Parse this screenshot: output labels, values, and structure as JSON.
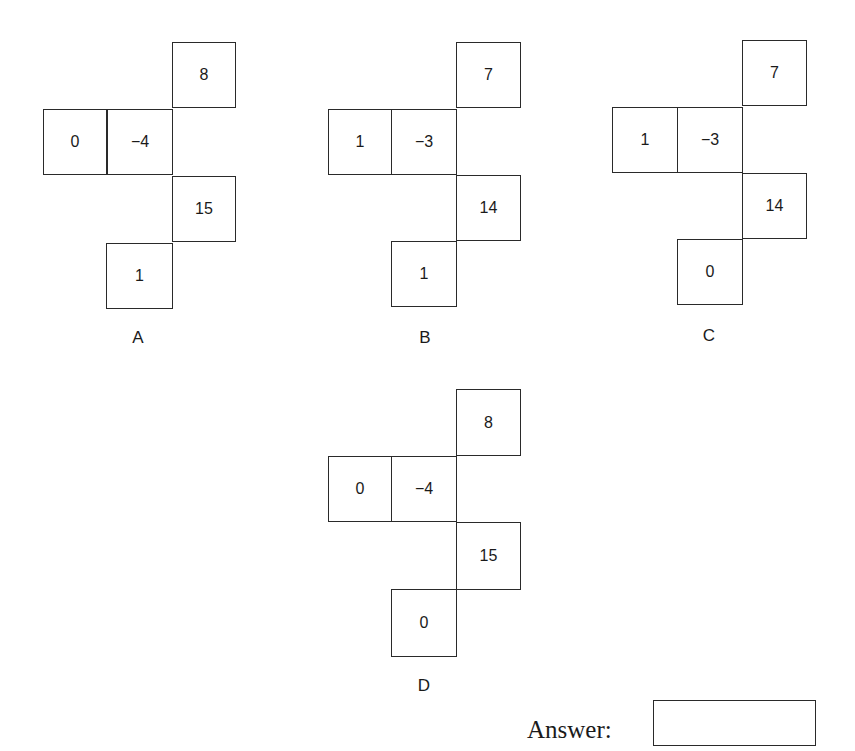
{
  "question": {
    "figures": [
      {
        "label": "A",
        "cells": {
          "top": "8",
          "left_outer": "0",
          "left_inner": "−4",
          "right_lower": "15",
          "bottom": "1"
        }
      },
      {
        "label": "B",
        "cells": {
          "top": "7",
          "left_outer": "1",
          "left_inner": "−3",
          "right_lower": "14",
          "bottom": "1"
        }
      },
      {
        "label": "C",
        "cells": {
          "top": "7",
          "left_outer": "1",
          "left_inner": "−3",
          "right_lower": "14",
          "bottom": "0"
        }
      },
      {
        "label": "D",
        "cells": {
          "top": "8",
          "left_outer": "0",
          "left_inner": "−4",
          "right_lower": "15",
          "bottom": "0"
        }
      }
    ],
    "answer": {
      "label": "Answer:",
      "value": ""
    }
  }
}
